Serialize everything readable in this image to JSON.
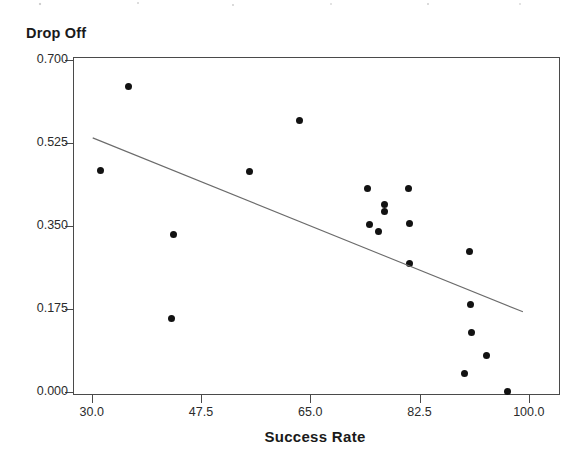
{
  "chart_data": {
    "type": "scatter",
    "title": "",
    "xlabel": "Success Rate",
    "ylabel": "Drop Off",
    "xlim": [
      27.0,
      105.0
    ],
    "ylim": [
      -0.0065,
      0.7065
    ],
    "grid": false,
    "legend": null,
    "xticks": [
      "30.0",
      "47.5",
      "65.0",
      "82.5",
      "100.0"
    ],
    "xtick_values": [
      30.0,
      47.5,
      65.0,
      82.5,
      100.0
    ],
    "yticks": [
      "0.000",
      "0.175",
      "0.350",
      "0.525",
      "0.700"
    ],
    "ytick_values": [
      0.0,
      0.175,
      0.35,
      0.525,
      0.7
    ],
    "marker": "filled-circle",
    "marker_color": "#121212",
    "points": [
      {
        "x": 35.8,
        "y": 0.646
      },
      {
        "x": 31.3,
        "y": 0.469
      },
      {
        "x": 43.0,
        "y": 0.335
      },
      {
        "x": 42.6,
        "y": 0.158
      },
      {
        "x": 55.1,
        "y": 0.467
      },
      {
        "x": 63.1,
        "y": 0.575
      },
      {
        "x": 74.0,
        "y": 0.431
      },
      {
        "x": 74.3,
        "y": 0.355
      },
      {
        "x": 76.8,
        "y": 0.398
      },
      {
        "x": 75.7,
        "y": 0.341
      },
      {
        "x": 76.7,
        "y": 0.382
      },
      {
        "x": 80.6,
        "y": 0.431
      },
      {
        "x": 80.8,
        "y": 0.358
      },
      {
        "x": 80.7,
        "y": 0.273
      },
      {
        "x": 90.3,
        "y": 0.298
      },
      {
        "x": 90.5,
        "y": 0.186
      },
      {
        "x": 90.7,
        "y": 0.128
      },
      {
        "x": 93.1,
        "y": 0.078
      },
      {
        "x": 89.5,
        "y": 0.041
      },
      {
        "x": 96.5,
        "y": 0.002
      }
    ],
    "fit_line": {
      "type": "linear-regression",
      "color": "#6b6b6b",
      "x_start": 30.0,
      "y_start": 0.538,
      "x_end": 98.9,
      "y_end": 0.171
    },
    "series_name": "Drop Off vs Success Rate",
    "n_points": 20
  },
  "axes": {
    "y_title": "Drop Off",
    "x_title": "Success Rate"
  }
}
